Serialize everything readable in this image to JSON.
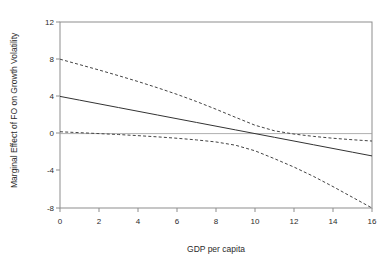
{
  "chart_data": {
    "type": "line",
    "title": "",
    "subtitle": "",
    "xlabel": "GDP per capita",
    "ylabel": "Marginal Effect of FO on Growth Volatility",
    "xlim": [
      0,
      16
    ],
    "ylim": [
      -8,
      12
    ],
    "xticks": [
      "0",
      "2",
      "4",
      "6",
      "8",
      "10",
      "12",
      "14",
      "16"
    ],
    "yticks": [
      "-8",
      "-4",
      "0",
      "4",
      "8",
      "12"
    ],
    "xtick_values": [
      0,
      2,
      4,
      6,
      8,
      10,
      12,
      14,
      16
    ],
    "ytick_values": [
      -8,
      -4,
      0,
      4,
      8,
      12
    ],
    "grid": false,
    "legend": "none",
    "zero_reference_line": 0,
    "x": [
      0,
      1,
      2,
      3,
      4,
      5,
      6,
      7,
      8,
      9,
      10,
      11,
      12,
      13,
      14,
      15,
      16
    ],
    "series": [
      {
        "name": "Marginal effect",
        "style": "solid",
        "color": "#333333",
        "values": [
          4.0,
          3.6,
          3.2,
          2.8,
          2.4,
          2.0,
          1.6,
          1.2,
          0.8,
          0.4,
          0.0,
          -0.4,
          -0.8,
          -1.2,
          -1.6,
          -2.0,
          -2.4
        ]
      },
      {
        "name": "Upper 95% confidence bound",
        "style": "dashed",
        "color": "#444444",
        "values": [
          8.0,
          7.42,
          6.84,
          6.23,
          5.6,
          4.93,
          4.22,
          3.45,
          2.62,
          1.75,
          0.9,
          0.3,
          -0.05,
          -0.3,
          -0.5,
          -0.66,
          -0.8
        ]
      },
      {
        "name": "Lower 95% confidence bound",
        "style": "dashed",
        "color": "#444444",
        "values": [
          0.2,
          0.1,
          0.0,
          -0.1,
          -0.22,
          -0.35,
          -0.5,
          -0.68,
          -0.9,
          -1.25,
          -1.85,
          -2.7,
          -3.6,
          -4.6,
          -5.7,
          -6.85,
          -8.0
        ]
      }
    ]
  },
  "axes": {
    "x_label_text": "GDP per capita",
    "y_label_text": "Marginal Effect of FO on Growth Volatility"
  }
}
